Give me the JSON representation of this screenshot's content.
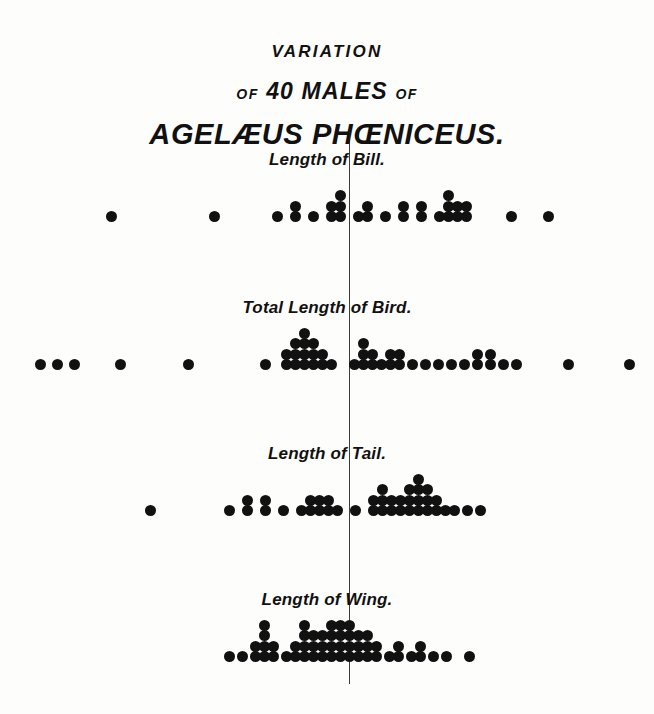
{
  "plate": {
    "background_color": "#fdfdfb",
    "ink_color": "#111111",
    "title_line_1": "VARIATION",
    "title_line_2_of_left": "OF",
    "title_line_2_main": "40 MALES",
    "title_line_2_of_right": "OF",
    "title_line_3": "AGELÆUS PHŒNICEUS."
  },
  "axis": {
    "center_x": 349,
    "top": 128,
    "bottom": 684
  },
  "chart_data": {
    "type": "scatter",
    "title": "VARIATION OF 40 MALES OF AGELÆUS PHŒNICEUS.",
    "subtitle": "",
    "xlabel": "",
    "ylabel": "",
    "grid": false,
    "legend": "none",
    "dot_diameter_px": 11,
    "column_pitch_px": 18,
    "series": [
      {
        "name": "Length of Bill",
        "label": "Length of Bill.",
        "baseline_y": 222,
        "mean_line_x": 349,
        "total_dots": 40,
        "columns": [
          {
            "x": 111,
            "count": 1
          },
          {
            "x": 214,
            "count": 1
          },
          {
            "x": 277,
            "count": 1
          },
          {
            "x": 295,
            "count": 2
          },
          {
            "x": 313,
            "count": 1
          },
          {
            "x": 331,
            "count": 2
          },
          {
            "x": 340,
            "count": 3
          },
          {
            "x": 358,
            "count": 1
          },
          {
            "x": 367,
            "count": 2
          },
          {
            "x": 385,
            "count": 1
          },
          {
            "x": 403,
            "count": 2
          },
          {
            "x": 421,
            "count": 2
          },
          {
            "x": 439,
            "count": 1
          },
          {
            "x": 448,
            "count": 3
          },
          {
            "x": 457,
            "count": 2
          },
          {
            "x": 466,
            "count": 2
          },
          {
            "x": 511,
            "count": 1
          },
          {
            "x": 548,
            "count": 1
          }
        ]
      },
      {
        "name": "Total Length of Bird",
        "label": "Total Length of Bird.",
        "baseline_y": 370,
        "mean_line_x": 349,
        "total_dots": 40,
        "columns": [
          {
            "x": 40,
            "count": 1
          },
          {
            "x": 57,
            "count": 1
          },
          {
            "x": 74,
            "count": 1
          },
          {
            "x": 120,
            "count": 1
          },
          {
            "x": 188,
            "count": 1
          },
          {
            "x": 265,
            "count": 1
          },
          {
            "x": 286,
            "count": 2
          },
          {
            "x": 295,
            "count": 3
          },
          {
            "x": 304,
            "count": 4
          },
          {
            "x": 313,
            "count": 3
          },
          {
            "x": 322,
            "count": 2
          },
          {
            "x": 331,
            "count": 1
          },
          {
            "x": 354,
            "count": 1
          },
          {
            "x": 363,
            "count": 3
          },
          {
            "x": 372,
            "count": 2
          },
          {
            "x": 381,
            "count": 1
          },
          {
            "x": 390,
            "count": 2
          },
          {
            "x": 399,
            "count": 2
          },
          {
            "x": 412,
            "count": 1
          },
          {
            "x": 425,
            "count": 1
          },
          {
            "x": 438,
            "count": 1
          },
          {
            "x": 451,
            "count": 1
          },
          {
            "x": 464,
            "count": 1
          },
          {
            "x": 477,
            "count": 2
          },
          {
            "x": 490,
            "count": 2
          },
          {
            "x": 503,
            "count": 1
          },
          {
            "x": 516,
            "count": 1
          },
          {
            "x": 568,
            "count": 1
          },
          {
            "x": 629,
            "count": 1
          }
        ]
      },
      {
        "name": "Length of Tail",
        "label": "Length of Tail.",
        "baseline_y": 516,
        "mean_line_x": 349,
        "total_dots": 40,
        "columns": [
          {
            "x": 150,
            "count": 1
          },
          {
            "x": 229,
            "count": 1
          },
          {
            "x": 247,
            "count": 2
          },
          {
            "x": 265,
            "count": 2
          },
          {
            "x": 283,
            "count": 1
          },
          {
            "x": 301,
            "count": 1
          },
          {
            "x": 310,
            "count": 2
          },
          {
            "x": 319,
            "count": 2
          },
          {
            "x": 328,
            "count": 2
          },
          {
            "x": 337,
            "count": 1
          },
          {
            "x": 355,
            "count": 1
          },
          {
            "x": 373,
            "count": 2
          },
          {
            "x": 382,
            "count": 3
          },
          {
            "x": 391,
            "count": 2
          },
          {
            "x": 400,
            "count": 2
          },
          {
            "x": 409,
            "count": 3
          },
          {
            "x": 418,
            "count": 4
          },
          {
            "x": 427,
            "count": 3
          },
          {
            "x": 436,
            "count": 2
          },
          {
            "x": 445,
            "count": 1
          },
          {
            "x": 454,
            "count": 1
          },
          {
            "x": 467,
            "count": 1
          },
          {
            "x": 480,
            "count": 1
          }
        ]
      },
      {
        "name": "Length of Wing",
        "label": "Length of Wing.",
        "baseline_y": 662,
        "mean_line_x": 349,
        "total_dots": 40,
        "columns": [
          {
            "x": 229,
            "count": 1
          },
          {
            "x": 242,
            "count": 1
          },
          {
            "x": 255,
            "count": 2
          },
          {
            "x": 264,
            "count": 4
          },
          {
            "x": 273,
            "count": 2
          },
          {
            "x": 286,
            "count": 1
          },
          {
            "x": 295,
            "count": 2
          },
          {
            "x": 304,
            "count": 4
          },
          {
            "x": 313,
            "count": 3
          },
          {
            "x": 322,
            "count": 3
          },
          {
            "x": 331,
            "count": 4
          },
          {
            "x": 340,
            "count": 4
          },
          {
            "x": 349,
            "count": 4
          },
          {
            "x": 358,
            "count": 3
          },
          {
            "x": 367,
            "count": 3
          },
          {
            "x": 376,
            "count": 2
          },
          {
            "x": 389,
            "count": 1
          },
          {
            "x": 398,
            "count": 2
          },
          {
            "x": 411,
            "count": 1
          },
          {
            "x": 420,
            "count": 2
          },
          {
            "x": 433,
            "count": 1
          },
          {
            "x": 446,
            "count": 1
          },
          {
            "x": 469,
            "count": 1
          }
        ]
      }
    ]
  }
}
